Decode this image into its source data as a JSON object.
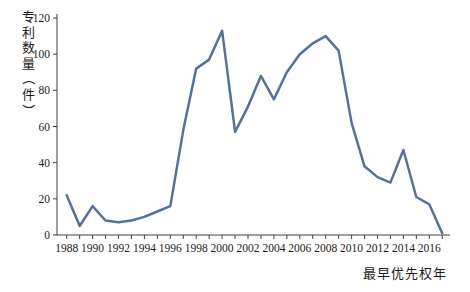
{
  "chart_data": {
    "type": "line",
    "title": "",
    "ylabel": "专利数量（件）",
    "xlabel": "最早优先权年",
    "x": [
      1988,
      1989,
      1990,
      1991,
      1992,
      1993,
      1994,
      1995,
      1996,
      1997,
      1998,
      1999,
      2000,
      2001,
      2002,
      2003,
      2004,
      2005,
      2006,
      2007,
      2008,
      2009,
      2010,
      2011,
      2012,
      2013,
      2014,
      2015,
      2016,
      2017
    ],
    "values": [
      22,
      5,
      16,
      8,
      7,
      8,
      10,
      13,
      16,
      58,
      92,
      97,
      113,
      57,
      71,
      88,
      75,
      90,
      100,
      106,
      110,
      102,
      62,
      38,
      32,
      29,
      47,
      21,
      17,
      1
    ],
    "x_tick_labels": [
      "1988",
      "1990",
      "1992",
      "1994",
      "1996",
      "1998",
      "2000",
      "2002",
      "2004",
      "2006",
      "2008",
      "2010",
      "2012",
      "2014",
      "2016"
    ],
    "x_tick_label_step": 2,
    "y_ticks": [
      0,
      20,
      40,
      60,
      80,
      100,
      120
    ],
    "ylim": [
      0,
      120
    ],
    "grid": false,
    "legend": false,
    "line_color": "#54719E",
    "axis_color": "#3f3f3f",
    "text_color": "#1b1b1b"
  }
}
